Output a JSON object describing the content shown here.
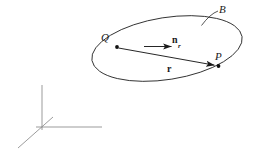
{
  "figure": {
    "type": "vector-diagram",
    "background_color": "#ffffff",
    "stroke_color": "#2a2a2a",
    "axes_stroke_color": "#8a8a8a",
    "labels": {
      "body": "B",
      "point_q": "Q",
      "point_p": "P",
      "unit_vector_base": "n",
      "unit_vector_subscript": "r",
      "position_vector": "r"
    },
    "geometry": {
      "ellipse": {
        "cx": 167,
        "cy": 48.5,
        "rx": 76,
        "ry": 31,
        "rotation_deg": -9
      },
      "leader_line": {
        "x1": 218,
        "y1": 11,
        "x2": 201,
        "y2": 26
      },
      "point_q_dot": {
        "cx": 117,
        "cy": 47,
        "r": 1.9
      },
      "point_p_dot": {
        "cx": 218.5,
        "cy": 66,
        "r": 1.9
      },
      "vector_r": {
        "x1": 118,
        "y1": 48,
        "x2": 215,
        "y2": 65
      },
      "vector_n_r": {
        "x1": 144,
        "y1": 46.5,
        "x2": 172,
        "y2": 46.5
      },
      "axes": {
        "origin": {
          "x": 42,
          "y": 127
        },
        "vertical_tip": {
          "x": 42,
          "y": 85
        },
        "horizontal_tip": {
          "x": 102,
          "y": 127
        },
        "diagonal_tip": {
          "x": 18,
          "y": 148
        },
        "diagonal_overshoot": {
          "x": 53,
          "y": 117
        }
      }
    }
  }
}
